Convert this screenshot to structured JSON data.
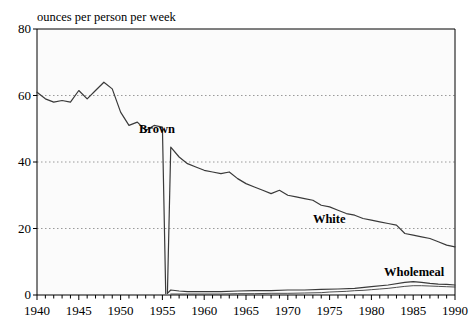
{
  "chart_data": {
    "type": "line",
    "title": "",
    "ylabel": "ounces per person per week",
    "xlabel": "",
    "xlim": [
      1940,
      1990
    ],
    "ylim": [
      0,
      80
    ],
    "yticks": [
      0,
      20,
      40,
      60,
      80
    ],
    "xticks": [
      1940,
      1945,
      1950,
      1955,
      1960,
      1965,
      1970,
      1975,
      1980,
      1985,
      1990
    ],
    "xtick_minor_step": 1,
    "grid": "horizontal-dotted",
    "legend": "inline-labels",
    "series": [
      {
        "name": "Brown",
        "label_x": 1952.2,
        "label_y": 49.5,
        "x": [
          1940,
          1941,
          1942,
          1943,
          1944,
          1945,
          1946,
          1947,
          1948,
          1949,
          1950,
          1951,
          1952,
          1953,
          1954,
          1955,
          1955.4
        ],
        "values": [
          61.0,
          59.0,
          58.0,
          58.5,
          58.0,
          61.5,
          59.0,
          61.5,
          64.0,
          62.0,
          55.0,
          51.0,
          52.0,
          49.5,
          51.0,
          50.5,
          0.4
        ]
      },
      {
        "name": "White",
        "label_x": 1973.0,
        "label_y": 22.5,
        "x": [
          1955.6,
          1956,
          1957,
          1958,
          1959,
          1960,
          1961,
          1962,
          1963,
          1964,
          1965,
          1966,
          1967,
          1968,
          1969,
          1970,
          1971,
          1972,
          1973,
          1974,
          1975,
          1976,
          1977,
          1978,
          1979,
          1980,
          1981,
          1982,
          1983,
          1984,
          1985,
          1986,
          1987,
          1988,
          1989,
          1990
        ],
        "values": [
          0.5,
          44.5,
          41.5,
          39.5,
          38.5,
          37.5,
          37.0,
          36.5,
          37.0,
          35.0,
          33.5,
          32.5,
          31.5,
          30.5,
          31.5,
          30.0,
          29.5,
          29.0,
          28.5,
          27.0,
          26.5,
          25.5,
          24.5,
          24.0,
          23.0,
          22.5,
          22.0,
          21.5,
          21.0,
          18.5,
          18.0,
          17.5,
          17.0,
          16.0,
          15.0,
          14.5
        ]
      },
      {
        "name": "Wholemeal",
        "label_x": 1981.5,
        "label_y": 6.5,
        "x": [
          1955.6,
          1956,
          1957,
          1958,
          1959,
          1960,
          1962,
          1964,
          1966,
          1968,
          1970,
          1972,
          1974,
          1976,
          1978,
          1980,
          1982,
          1984,
          1985,
          1986,
          1987,
          1988,
          1989,
          1990
        ],
        "values": [
          0.5,
          1.5,
          1.2,
          1.0,
          1.0,
          1.0,
          1.0,
          1.2,
          1.3,
          1.3,
          1.5,
          1.5,
          1.7,
          1.8,
          2.0,
          2.5,
          3.0,
          3.8,
          4.0,
          3.8,
          3.5,
          3.3,
          3.2,
          3.0
        ]
      },
      {
        "name": "Other",
        "label_x": null,
        "label_y": null,
        "x": [
          1956,
          1958,
          1960,
          1962,
          1964,
          1966,
          1968,
          1970,
          1972,
          1974,
          1975,
          1976,
          1977,
          1978,
          1979,
          1980,
          1981,
          1982,
          1983,
          1984,
          1985,
          1986,
          1987,
          1988,
          1989,
          1990
        ],
        "values": [
          0.3,
          0.3,
          0.3,
          0.3,
          0.4,
          0.4,
          0.5,
          0.5,
          0.6,
          0.7,
          0.9,
          1.0,
          1.1,
          1.3,
          1.4,
          1.6,
          1.8,
          2.0,
          2.3,
          2.6,
          2.8,
          2.8,
          2.7,
          2.6,
          2.5,
          2.4
        ]
      }
    ]
  },
  "colors": {
    "line": "#3a3a3a",
    "grid": "#9a9a9a",
    "axis": "#000000",
    "plot_background": "#fbfbfb"
  }
}
